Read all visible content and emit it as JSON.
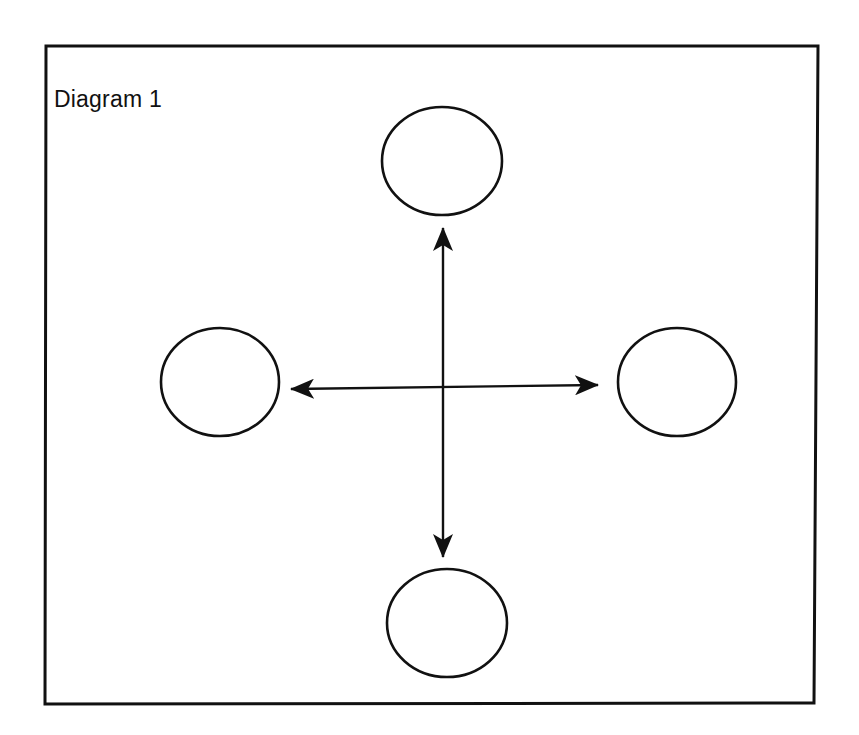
{
  "diagram": {
    "title": "Diagram 1",
    "type": "hub-and-spoke",
    "stroke_color": "#111111",
    "background_color": "#ffffff",
    "frame": {
      "corners": {
        "top_left": [
          46,
          46
        ],
        "top_right": [
          818,
          46
        ],
        "bottom_right": [
          814,
          703
        ],
        "bottom_left": [
          45,
          704
        ]
      },
      "stroke_width": 3
    },
    "hub": {
      "center": [
        443,
        388
      ]
    },
    "nodes": [
      {
        "id": "top",
        "label": "",
        "cx": 442,
        "cy": 161,
        "rx": 60,
        "ry": 54
      },
      {
        "id": "left",
        "label": "",
        "cx": 220,
        "cy": 382,
        "rx": 59,
        "ry": 54
      },
      {
        "id": "right",
        "label": "",
        "cx": 677,
        "cy": 382,
        "rx": 59,
        "ry": 54
      },
      {
        "id": "bottom",
        "label": "",
        "cx": 447,
        "cy": 623,
        "rx": 60,
        "ry": 54
      }
    ],
    "edges": [
      {
        "id": "vertical",
        "from": "top",
        "to": "bottom",
        "x1": 443,
        "y1": 228,
        "x2": 443,
        "y2": 557,
        "arrowheads": "both"
      },
      {
        "id": "horizontal",
        "from": "left",
        "to": "right",
        "x1": 291,
        "y1": 389,
        "x2": 598,
        "y2": 385,
        "arrowheads": "both"
      }
    ]
  }
}
